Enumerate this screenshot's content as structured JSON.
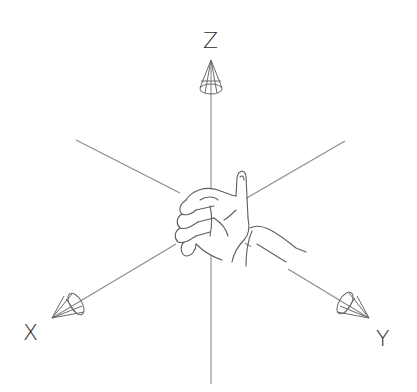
{
  "diagram": {
    "type": "3d-coordinate-axes",
    "axes": [
      {
        "name": "Z",
        "label": "Z",
        "direction": "up"
      },
      {
        "name": "X",
        "label": "X",
        "direction": "down-left"
      },
      {
        "name": "Y",
        "label": "Y",
        "direction": "down-right"
      }
    ],
    "center_object": "hand",
    "colors": {
      "line": "#8a8a8a",
      "cone": "#6a6a6a",
      "hand": "#5e5e5e",
      "label": "#2b2b2b",
      "background": "#ffffff"
    }
  }
}
